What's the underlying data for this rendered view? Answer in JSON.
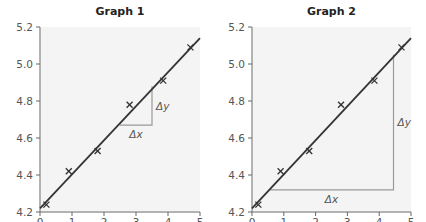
{
  "chart_data": [
    {
      "type": "scatter",
      "title": "Graph 1",
      "xlabel": "",
      "ylabel": "",
      "xlim": [
        0,
        5
      ],
      "ylim": [
        4.2,
        5.2
      ],
      "x_ticks": [
        "0",
        "1",
        "2",
        "3",
        "4",
        "5"
      ],
      "y_ticks": [
        "4.2",
        "4.4",
        "4.6",
        "4.8",
        "5.0",
        "5.2"
      ],
      "grid": false,
      "points": [
        {
          "x": 0.2,
          "y": 4.24
        },
        {
          "x": 0.9,
          "y": 4.42
        },
        {
          "x": 1.8,
          "y": 4.53
        },
        {
          "x": 2.8,
          "y": 4.78
        },
        {
          "x": 3.85,
          "y": 4.91
        },
        {
          "x": 4.7,
          "y": 5.09
        }
      ],
      "best_fit_line": {
        "x0": 0.0,
        "y0": 4.22,
        "x1": 5.0,
        "y1": 5.14
      },
      "gradient_triangle": {
        "x_from": 2.5,
        "x_to": 3.5,
        "y_from": 4.67,
        "y_to": 4.88,
        "dx_label": "Δx",
        "dy_label": "Δy"
      }
    },
    {
      "type": "scatter",
      "title": "Graph 2",
      "xlabel": "",
      "ylabel": "",
      "xlim": [
        0,
        5
      ],
      "ylim": [
        4.2,
        5.2
      ],
      "x_ticks": [
        "0",
        "1",
        "2",
        "3",
        "4",
        "5"
      ],
      "y_ticks": [
        "4.2",
        "4.4",
        "4.6",
        "4.8",
        "5.0",
        "5.2"
      ],
      "grid": false,
      "points": [
        {
          "x": 0.2,
          "y": 4.24
        },
        {
          "x": 0.9,
          "y": 4.42
        },
        {
          "x": 1.8,
          "y": 4.53
        },
        {
          "x": 2.8,
          "y": 4.78
        },
        {
          "x": 3.85,
          "y": 4.91
        },
        {
          "x": 4.7,
          "y": 5.09
        }
      ],
      "best_fit_line": {
        "x0": 0.0,
        "y0": 4.22,
        "x1": 5.0,
        "y1": 5.14
      },
      "gradient_triangle": {
        "x_from": 0.55,
        "x_to": 4.45,
        "y_from": 4.32,
        "y_to": 5.05,
        "dx_label": "Δx",
        "dy_label": "Δy"
      }
    }
  ],
  "graphs": [
    {
      "title": "Graph 1"
    },
    {
      "title": "Graph 2"
    }
  ],
  "colors": {
    "line": "#333333",
    "triangle": "#999999",
    "marker": "#333333",
    "plot_bg": "#f4f4f4",
    "axis": "#666666"
  }
}
